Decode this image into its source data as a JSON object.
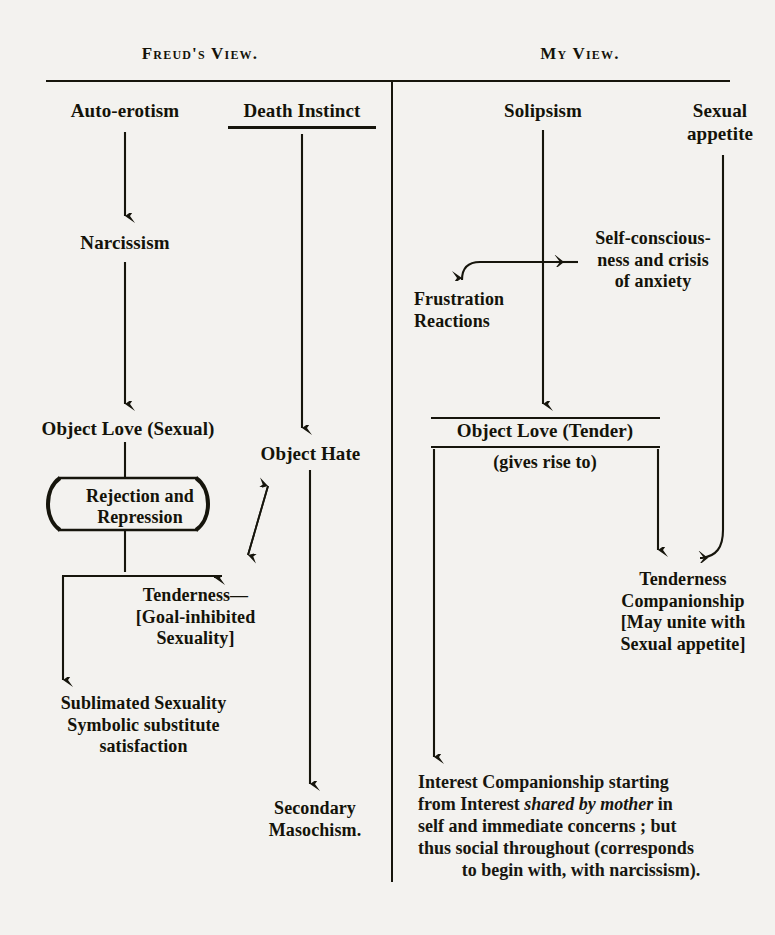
{
  "document": {
    "title": "Freud's View and My View — comparative psychoanalytic development diagram",
    "background_color": "#f3f2ef",
    "ink_color": "#16150c"
  },
  "columns": {
    "left": {
      "header": "Freud's View."
    },
    "right": {
      "header": "My View."
    }
  },
  "left_column": {
    "nodes": [
      {
        "id": "auto-erotism",
        "label": "Auto-erotism",
        "underlined": false
      },
      {
        "id": "death-instinct",
        "label": "Death Instinct",
        "underlined": true
      },
      {
        "id": "narcissism",
        "label": "Narcissism",
        "underlined": false
      },
      {
        "id": "object-love-sexual",
        "label": "Object Love (Sexual)",
        "underlined": false
      },
      {
        "id": "object-hate",
        "label": "Object Hate",
        "underlined": false
      },
      {
        "id": "rejection-and-repression",
        "label": "Rejection and\nRepression",
        "underlined": false
      },
      {
        "id": "tenderness-goal-inhibited",
        "label": "Tenderness—\n[Goal-inhibited\nSexuality]",
        "underlined": false
      },
      {
        "id": "sublimated-sexuality",
        "label": "Sublimated Sexuality\nSymbolic substitute\nsatisfaction",
        "underlined": false
      },
      {
        "id": "secondary-masochism",
        "label": "Secondary\nMasochism.",
        "underlined": false
      }
    ]
  },
  "right_column": {
    "nodes": [
      {
        "id": "solipsism",
        "label": "Solipsism",
        "underlined": false
      },
      {
        "id": "sexual-appetite",
        "label": "Sexual\nappetite",
        "underlined": false
      },
      {
        "id": "self-consciousness",
        "label": "Self-conscious-\nness and crisis\nof anxiety",
        "underlined": false
      },
      {
        "id": "frustration-reactions",
        "label": "Frustration\nReactions",
        "underlined": false
      },
      {
        "id": "object-love-tender",
        "label": "Object Love (Tender)",
        "underlined": false
      },
      {
        "id": "gives-rise-to",
        "label": "(gives rise to)",
        "underlined": false
      },
      {
        "id": "tenderness-companionship",
        "label": "Tenderness\nCompanionship\n[May unite with\nSexual appetite]",
        "underlined": false
      },
      {
        "id": "interest-companionship",
        "label": "Interest Companionship starting from Interest shared by mother in self and immediate concerns ; but thus social throughout (corresponds to begin with, with narcissism).",
        "underlined": false
      }
    ],
    "interest_paragraph": {
      "line1_a": "Interest Companionship ",
      "line1_b": "starting",
      "line2_a": "from Interest ",
      "line2_italic": "shared by mother",
      "line2_b": " in",
      "line3": "self and immediate concerns ; but",
      "line4": "thus social throughout (corresponds",
      "line5": "to begin with, with narcissism)."
    }
  },
  "connectors": [
    {
      "id": "auto-erotism-to-narcissism",
      "kind": "arrow-down"
    },
    {
      "id": "narcissism-to-object-love-sexual",
      "kind": "arrow-down"
    },
    {
      "id": "death-instinct-to-object-hate",
      "kind": "arrow-down"
    },
    {
      "id": "object-hate-to-secondary-masochism",
      "kind": "arrow-down"
    },
    {
      "id": "object-love-sexual-to-rejection-box",
      "kind": "line-down"
    },
    {
      "id": "rejection-box-to-tenderness",
      "kind": "arrow-down"
    },
    {
      "id": "tenderness-bar-to-sublimated",
      "kind": "arrow-down"
    },
    {
      "id": "object-hate-tenderness-double-arrow",
      "kind": "double-headed-diagonal-arrow"
    },
    {
      "id": "solipsism-to-object-love-tender",
      "kind": "arrow-down"
    },
    {
      "id": "self-consciousness-to-frustration",
      "kind": "curved-arrow-left-down"
    },
    {
      "id": "self-consciousness-into-spine",
      "kind": "arrow-left"
    },
    {
      "id": "sexual-appetite-to-tenderness-companionship",
      "kind": "curved-arrow-down-left"
    },
    {
      "id": "object-love-tender-to-tenderness-companionship",
      "kind": "arrow-down"
    },
    {
      "id": "object-love-tender-to-interest-companionship",
      "kind": "arrow-down"
    }
  ]
}
